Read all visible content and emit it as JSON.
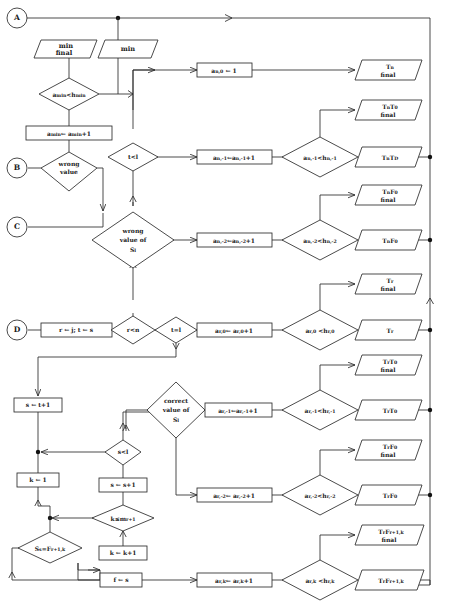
{
  "diagram": {
    "type": "flowchart",
    "colors": {
      "stroke": "#2b2b2b",
      "fill": "#ffffff",
      "text": "#1a1a1a"
    }
  },
  "connectors": {
    "a": "A",
    "b": "B",
    "c": "C",
    "d": "D"
  },
  "io": {
    "min_final": {
      "l1": "min",
      "l2": "final"
    },
    "min": "min"
  },
  "decisions": {
    "a_min_lt_h_min": {
      "base": "a",
      "sub": "min",
      "op": "<h",
      "sub2": "min"
    },
    "wrong_value": {
      "l1": "wrong",
      "l2": "value"
    },
    "t_lt_l": "t<l",
    "wrong_value_of_Sl": {
      "l1": "wrong",
      "l2": "value of",
      "l3": "S",
      "l3sub": "l"
    },
    "r_lt_n": "r<n",
    "t_eq_l": "t=l",
    "correct_value_of_Sl": {
      "l1": "correct",
      "l2": "value of",
      "l3": "S",
      "l3sub": "l"
    },
    "s_lt_l": "s<l",
    "k_le_m": {
      "base": "k≤m",
      "sub": "r+1"
    },
    "Ss_eq_F": {
      "base": "S",
      "sub": "s",
      "mid": "=F",
      "sub2": "r+1,k"
    },
    "an0_cmp": {
      "lhs": "a",
      "lhs_sub": "n,-1",
      "op": "<h",
      "rhs_sub": "n,-1"
    },
    "an2_cmp": {
      "lhs": "a",
      "lhs_sub": "n,-2",
      "op": "<h",
      "rhs_sub": "n,-2"
    },
    "ar0_cmp": {
      "lhs": "a",
      "lhs_sub": "r,0",
      "op": "<h",
      "rhs_sub": "r,0"
    },
    "ar1_cmp": {
      "lhs": "a",
      "lhs_sub": "r,-1",
      "op": "<h",
      "rhs_sub": "r,-1"
    },
    "ar2_cmp": {
      "lhs": "a",
      "lhs_sub": "r,-2",
      "op": "<h",
      "rhs_sub": "r,-2"
    },
    "ark_cmp": {
      "lhs": "a",
      "lhs_sub": "r,k",
      "op": "<h",
      "rhs_sub": "r,k"
    }
  },
  "processes": {
    "amin_inc": {
      "lhs": "a",
      "lhs_sub": "min",
      "arrow": "← a",
      "rhs_sub": "min",
      "tail": "+1"
    },
    "an0_set": {
      "lhs": "a",
      "lhs_sub": "n,0",
      "arrow": "←",
      "tail": "1"
    },
    "an1_inc": {
      "lhs": "a",
      "lhs_sub": "n,-1",
      "arrow": "←a",
      "rhs_sub": "n,-1",
      "tail": "+1"
    },
    "an2_inc": {
      "lhs": "a",
      "lhs_sub": "n,-2",
      "arrow": "←a",
      "rhs_sub": "n,-2",
      "tail": "+1"
    },
    "ar0_inc": {
      "lhs": "a",
      "lhs_sub": "r,0",
      "arrow": "← a",
      "rhs_sub": "r,0",
      "tail": "+1"
    },
    "ar1_inc": {
      "lhs": "a",
      "lhs_sub": "r,-1",
      "arrow": "←a",
      "rhs_sub": "r,-1",
      "tail": "+1"
    },
    "ar2_inc": {
      "lhs": "a",
      "lhs_sub": "r,-2",
      "arrow": "← a",
      "rhs_sub": "r,-2",
      "tail": "+1"
    },
    "ark_inc": {
      "lhs": "a",
      "lhs_sub": "r,k",
      "arrow": "← a",
      "rhs_sub": "r,k",
      "tail": "+1"
    },
    "init_rt": "r ← j;  t ← s",
    "s_set": "s ← t+1",
    "s_inc": "s ← s+1",
    "k_set": "k ← 1",
    "k_inc": "k ← k+1",
    "f_set": "f ← s"
  },
  "outputs": {
    "Tn_final": {
      "base": "T",
      "sub": "n",
      "final": "final"
    },
    "TnT0_final": {
      "base": "T",
      "sub": "n",
      "base2": "T",
      "sub2": "0",
      "final": "final"
    },
    "TnTD": {
      "base": "T",
      "sub": "n",
      "base2": "T",
      "sub2": "D"
    },
    "TnF0_final": {
      "base": "T",
      "sub": "n",
      "base2": "F",
      "sub2": "0",
      "final": "final"
    },
    "TnF0": {
      "base": "T",
      "sub": "n",
      "base2": "F",
      "sub2": "0"
    },
    "Tr_final": {
      "base": "T",
      "sub": "r",
      "final": "final"
    },
    "Tr": {
      "base": "T",
      "sub": "r"
    },
    "TrT0_final": {
      "base": "T",
      "sub": "r",
      "base2": "T",
      "sub2": "0",
      "final": "final"
    },
    "TrT0": {
      "base": "T",
      "sub": "r",
      "base2": "T",
      "sub2": "0"
    },
    "TrF0_final": {
      "base": "T",
      "sub": "r",
      "base2": "F",
      "sub2": "0",
      "final": "final"
    },
    "TrF0": {
      "base": "T",
      "sub": "r",
      "base2": "F",
      "sub2": "0"
    },
    "TrFrk_final": {
      "base": "T",
      "sub": "r",
      "base2": "F",
      "sub2": "r+1,k",
      "final": "final"
    },
    "TrFrk": {
      "base": "T",
      "sub": "r",
      "base2": "F",
      "sub2": "r+1,k"
    }
  }
}
